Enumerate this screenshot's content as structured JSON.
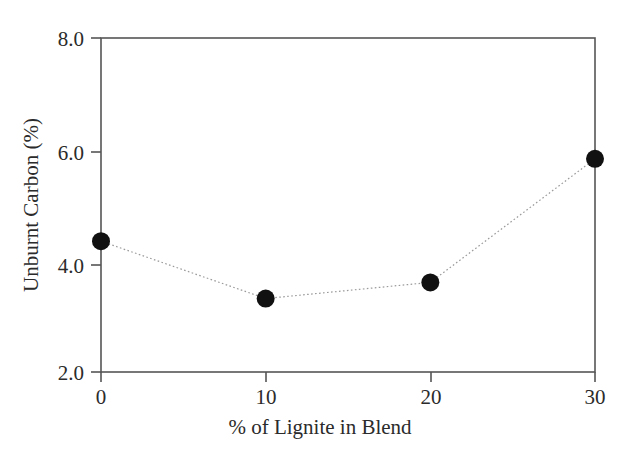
{
  "chart_data": {
    "type": "line",
    "title": "",
    "xlabel": "% of Lignite in Blend",
    "ylabel": "Unburnt Carbon (%)",
    "x": [
      0,
      10,
      20,
      30
    ],
    "values": [
      4.35,
      3.32,
      3.61,
      5.83
    ],
    "series": [
      {
        "name": "Unburnt Carbon",
        "x": [
          0,
          10,
          20,
          30
        ],
        "values": [
          4.35,
          3.32,
          3.61,
          5.83
        ]
      }
    ],
    "xlim": [
      0,
      30
    ],
    "ylim": [
      2.0,
      8.0
    ],
    "xticks": [
      0,
      10,
      20,
      30
    ],
    "yticks": [
      2.0,
      4.0,
      6.0,
      8.0
    ],
    "xtick_labels": [
      "0",
      "10",
      "20",
      "30"
    ],
    "ytick_labels": [
      "2.0",
      "4.0",
      "6.0",
      "8.0"
    ],
    "grid": false,
    "legend": null,
    "marker": "filled-circle",
    "line_style": "dotted",
    "marker_color": "#111111",
    "line_color": "#9a9a9a",
    "axis_color": "#555555",
    "background": "#ffffff"
  },
  "axes": {
    "y_tick_0": "8.0",
    "y_tick_1": "6.0",
    "y_tick_2": "4.0",
    "y_tick_3": "2.0",
    "x_tick_0": "0",
    "x_tick_1": "10",
    "x_tick_2": "20",
    "x_tick_3": "30",
    "x_title": "% of Lignite in Blend",
    "y_title": "Unburnt Carbon (%)"
  }
}
